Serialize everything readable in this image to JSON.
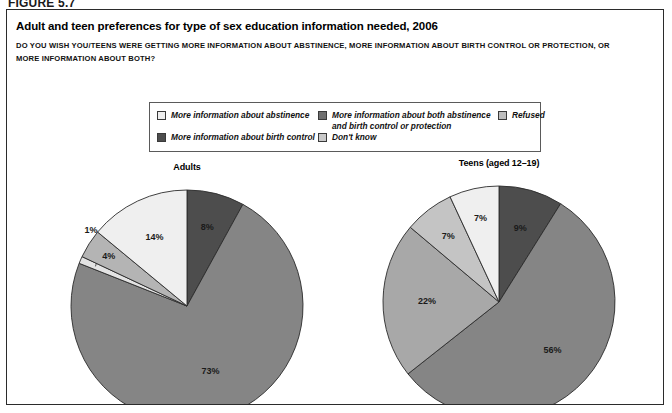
{
  "figure": {
    "label": "FIGURE 5.7"
  },
  "header": {
    "title": "Adult and teen preferences for type of sex education information needed, 2006",
    "subtitle": "DO YOU WISH YOU/TEENS WERE GETTING MORE INFORMATION ABOUT ABSTINENCE, MORE INFORMATION ABOUT BIRTH CONTROL OR PROTECTION, OR MORE INFORMATION ABOUT BOTH?"
  },
  "legend": {
    "items": [
      {
        "label": "More information about abstinence",
        "color": "#efefef"
      },
      {
        "label": "More information about birth control",
        "color": "#4d4d4d"
      },
      {
        "label": "More information about both abstinence\nand birth control or protection",
        "color": "#6f6f6f"
      },
      {
        "label": "Don't know",
        "color": "#c9c9c9"
      },
      {
        "label": "Refused",
        "color": "#bdbdbd"
      }
    ]
  },
  "chart_data": [
    {
      "type": "pie",
      "title": "Adults",
      "categories": [
        "More information about both abstinence and birth control or protection",
        "More information about birth control",
        "Refused",
        "Don't know",
        "More information about abstinence"
      ],
      "values": [
        8,
        73,
        1,
        4,
        14
      ],
      "labels": [
        "8%",
        "73%",
        "1%",
        "4%",
        "14%"
      ],
      "colors": [
        "#4d4d4d",
        "#858585",
        "#e3e3e3",
        "#b4b4b4",
        "#efefef"
      ],
      "legend_position": "top",
      "grid": false,
      "xlabel": "",
      "ylabel": ""
    },
    {
      "type": "pie",
      "title": "Teens (aged 12–19)",
      "categories": [
        "More information about both abstinence and birth control or protection",
        "More information about birth control",
        "Refused",
        "Don't know",
        "More information about abstinence"
      ],
      "values": [
        9,
        56,
        22,
        7,
        7
      ],
      "labels": [
        "9%",
        "56%",
        "22%",
        "7%",
        "7%"
      ],
      "colors": [
        "#4d4d4d",
        "#858585",
        "#a8a8a8",
        "#c4c4c4",
        "#efefef"
      ],
      "legend_position": "top",
      "grid": false,
      "xlabel": "",
      "ylabel": ""
    }
  ]
}
